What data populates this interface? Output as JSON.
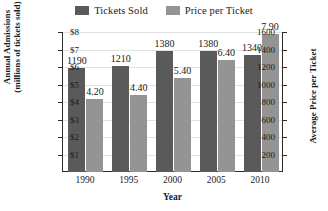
{
  "chart_data": {
    "type": "bar",
    "title": "",
    "categories": [
      "1990",
      "1995",
      "2000",
      "2005",
      "2010"
    ],
    "xlabel": "Year",
    "grid": true,
    "legend_position": "top-center",
    "series": [
      {
        "name": "Tickets Sold",
        "axis": "left",
        "color": "#5a5a5a",
        "values": [
          1190,
          1210,
          1380,
          1380,
          1340
        ],
        "labels": [
          "1190",
          "1210",
          "1380",
          "1380",
          "1340"
        ]
      },
      {
        "name": "Price per Ticket",
        "axis": "right",
        "color": "#949494",
        "values": [
          4.2,
          4.4,
          5.4,
          6.4,
          7.9
        ],
        "labels": [
          "4.20",
          "4.40",
          "5.40",
          "6.40",
          "7.90"
        ]
      }
    ],
    "axes": {
      "left": {
        "title_line1": "Annual Admissions",
        "title_line2": "(millions of tickets sold)",
        "ticks": [
          "1600",
          "1400",
          "1200",
          "1000",
          "800",
          "600",
          "400",
          "200"
        ],
        "tick_values": [
          1600,
          1400,
          1200,
          1000,
          800,
          600,
          400,
          200
        ],
        "ylim": [
          0,
          1600
        ]
      },
      "right": {
        "title": "Average Price per Ticket",
        "ticks": [
          "$8",
          "$7",
          "$6",
          "$5",
          "$4",
          "$3",
          "$2",
          "$1"
        ],
        "tick_values": [
          8,
          7,
          6,
          5,
          4,
          3,
          2,
          1
        ],
        "ylim": [
          0,
          8
        ]
      }
    }
  },
  "legend": {
    "entries": [
      {
        "label": "Tickets Sold",
        "color": "#5a5a5a"
      },
      {
        "label": "Price per Ticket",
        "color": "#949494"
      }
    ]
  }
}
